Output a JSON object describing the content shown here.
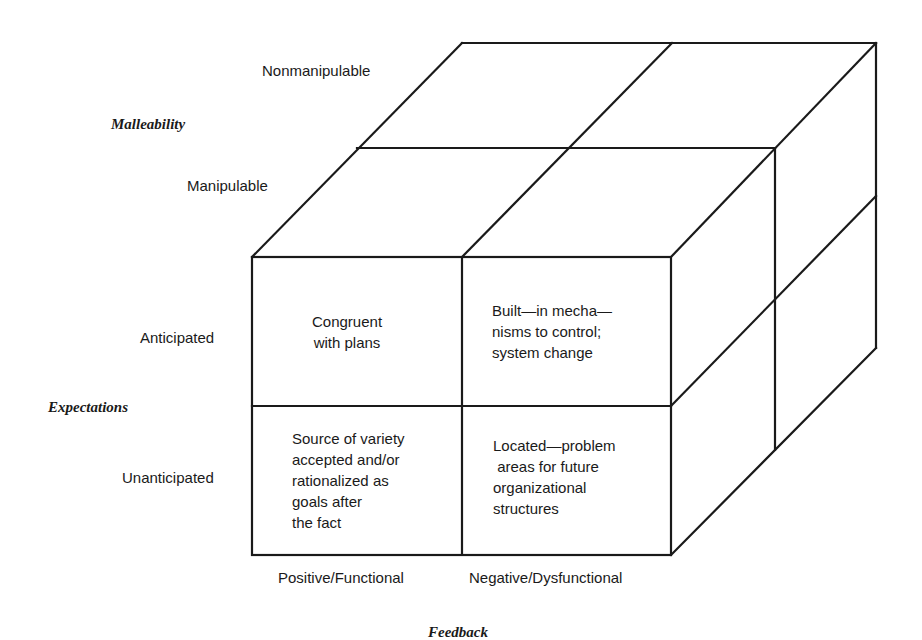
{
  "diagram": {
    "type": "3d-cube-matrix",
    "axes": {
      "malleability": {
        "title": "Malleability",
        "levels": [
          "Nonmanipulable",
          "Manipulable"
        ]
      },
      "expectations": {
        "title": "Expectations",
        "levels": [
          "Anticipated",
          "Unanticipated"
        ]
      },
      "feedback": {
        "title": "Feedback",
        "levels": [
          "Positive/Functional",
          "Negative/Dysfunctional"
        ]
      }
    },
    "cells": [
      {
        "row": "Anticipated",
        "col": "Positive/Functional",
        "text": "Congruent\nwith plans"
      },
      {
        "row": "Anticipated",
        "col": "Negative/Dysfunctional",
        "text": "Built—in mecha—\nnisms to control;\nsystem change"
      },
      {
        "row": "Unanticipated",
        "col": "Positive/Functional",
        "text": "Source of variety\naccepted and/or\nrationalized as\ngoals after\nthe fact"
      },
      {
        "row": "Unanticipated",
        "col": "Negative/Dysfunctional",
        "text": "Located—problem\n areas for future\norganizational\nstructures"
      }
    ],
    "line_color": "#1a1a1a"
  }
}
